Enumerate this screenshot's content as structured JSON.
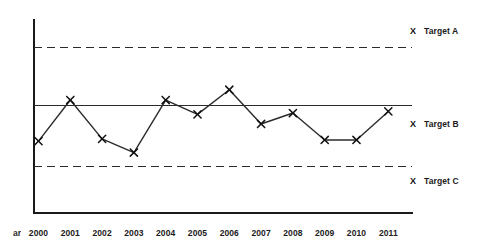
{
  "chart_data": {
    "type": "line",
    "title": "",
    "subtitle": "",
    "xlabel": "Year",
    "ylabel": "",
    "grid": false,
    "legend_position": "right",
    "categories": [
      "2000",
      "2001",
      "2002",
      "2003",
      "2004",
      "2005",
      "2006",
      "2007",
      "2008",
      "2009",
      "2010",
      "2011"
    ],
    "series": [
      {
        "name": "Performance",
        "marker": "x",
        "values": [
          -1.05,
          0.75,
          -0.95,
          -1.55,
          0.75,
          0.12,
          1.2,
          -0.3,
          0.18,
          -1.0,
          -1.0,
          0.25
        ]
      }
    ],
    "reference_lines": [
      {
        "name": "Target A",
        "value": 2.6,
        "style": "dashed"
      },
      {
        "name": "Target B",
        "value": 0.0,
        "style": "solid"
      },
      {
        "name": "Target C",
        "value": -2.35,
        "style": "dashed"
      }
    ],
    "ylim": [
      -4.2,
      4.3
    ],
    "axis_min_label": "",
    "axis_max_label": ""
  },
  "axis": {
    "caption": "ar",
    "caption_full": "Year",
    "tick_labels": [
      "2000",
      "2001",
      "2002",
      "2003",
      "2004",
      "2005",
      "2006",
      "2007",
      "2008",
      "2009",
      "2010",
      "2011"
    ]
  },
  "legend": {
    "marker_glyph": "X",
    "items": [
      {
        "label": "Target A"
      },
      {
        "label": "Target B"
      },
      {
        "label": "Target C"
      }
    ]
  },
  "colors": {
    "axis": "#1a1a1a",
    "series_line": "#2b2b2b",
    "marker": "#111111",
    "reference_line": "#2b2b2b",
    "background": "#ffffff",
    "text": "#1a1a1a"
  }
}
